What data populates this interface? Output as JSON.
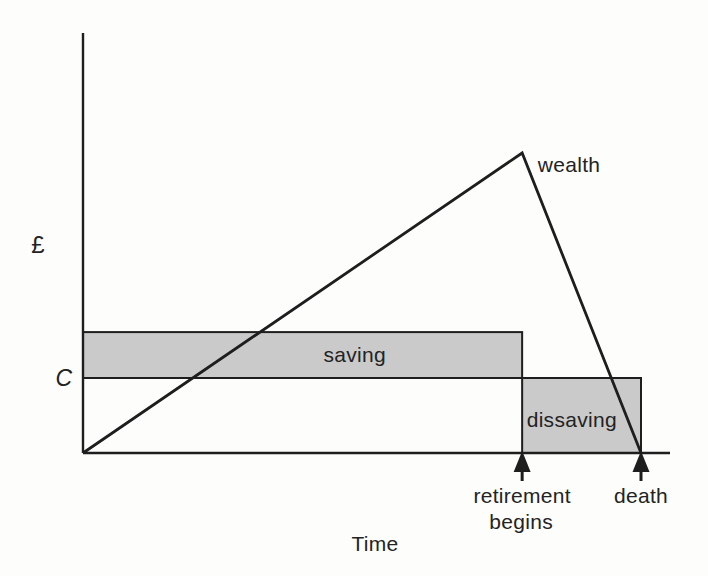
{
  "figure": {
    "background": "#fdfdfb",
    "ink_color": "#1e1e1e",
    "region_fill": "#cacaca"
  },
  "chart_data": {
    "type": "line",
    "title": "",
    "xlabel": "Time",
    "ylabel": "£",
    "x_range": [
      0,
      1.052
    ],
    "y_range": [
      0,
      1.4
    ],
    "grid": false,
    "legend": "none",
    "axis_units": "qualitative (no numeric ticks); time normalized so death = 1.0, wealth normalized so peak wealth at retirement = 1.0, consumption level C = 0.25",
    "series": [
      {
        "name": "wealth",
        "color": "#1e1e1e",
        "x": [
          0,
          0.787,
          1.0
        ],
        "y": [
          0,
          1.0,
          0
        ],
        "label_anchor": [
          0.815,
          0.937
        ]
      }
    ],
    "regions": [
      {
        "id": "saving",
        "label": "saving",
        "x": [
          0,
          0.787
        ],
        "y": [
          0.25,
          0.403
        ],
        "fill": "#cacaca",
        "label_anchor": [
          0.487,
          0.305
        ]
      },
      {
        "id": "dissaving",
        "label": "dissaving",
        "x": [
          0.787,
          1.0
        ],
        "y": [
          0,
          0.25
        ],
        "fill": "#cacaca",
        "label_anchor": [
          0.876,
          0.087
        ]
      }
    ],
    "y_marks": [
      {
        "label": "C",
        "y": 0.25
      }
    ],
    "x_marks": [
      {
        "x": 0.787,
        "lines": [
          "retirement",
          "begins"
        ]
      },
      {
        "x": 1.0,
        "lines": [
          "death"
        ]
      }
    ]
  }
}
